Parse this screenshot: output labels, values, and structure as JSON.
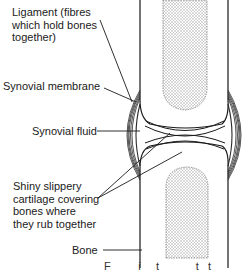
{
  "diagram": {
    "labels": {
      "ligament": [
        "Ligament (fibres",
        "which hold bones",
        "together)"
      ],
      "synovial_membrane": "Synovial membrane",
      "synovial_fluid": "Synovial fluid",
      "cartilage": [
        "Shiny slippery",
        "cartilage covering",
        "bones where",
        "they rub together"
      ],
      "bone": "Bone",
      "caption_fragment": "F         i     t            t   t"
    },
    "colors": {
      "line": "#1a1a1a",
      "marrow": "#c8c8c8",
      "background": "#ffffff"
    }
  }
}
